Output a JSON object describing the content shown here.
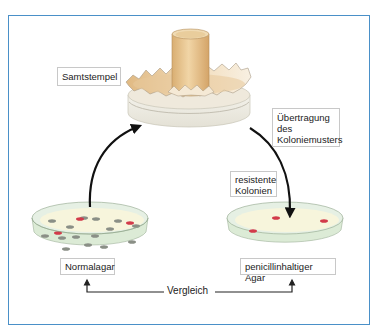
{
  "diagram": {
    "labels": {
      "stamp": "Samtstempel",
      "transfer": "Übertragung\ndes\nKoloniemusters",
      "resistant": "resistente\nKolonien",
      "normal_agar": "Normalagar",
      "penicillin_agar": "penicillinhaltiger Agar",
      "comparison": "Vergleich"
    },
    "colors": {
      "frame": "#4a90c8",
      "stamp_wood": "#e8c590",
      "stamp_base": "#f6f3ea",
      "agar": "#f7f5dc",
      "dish": "#dcebd6",
      "colony_normal": "#8a8f86",
      "colony_resistant": "#d23a4a",
      "arrow": "#111111"
    },
    "petri_left": {
      "name": "Normalagar",
      "gray_colonies": 14,
      "red_colonies": 3
    },
    "petri_right": {
      "name": "penicillinhaltiger Agar",
      "red_colonies": 3
    }
  }
}
